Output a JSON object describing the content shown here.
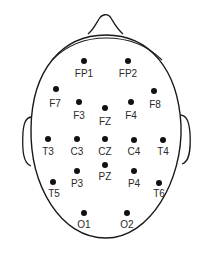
{
  "diagram": {
    "title": "",
    "type": "EEG 10-20 electrode placement (top view of head)",
    "colors": {
      "line": "#1a1a1a",
      "dot": "#111111",
      "text": "#2a2a2a",
      "background": "#ffffff"
    },
    "electrodes": [
      {
        "id": "fp1",
        "label": "FP1",
        "x": 84,
        "y": 61,
        "lx": 84,
        "ly": 69
      },
      {
        "id": "fp2",
        "label": "FP2",
        "x": 128,
        "y": 61,
        "lx": 128,
        "ly": 69
      },
      {
        "id": "f7",
        "label": "F7",
        "x": 56,
        "y": 89,
        "lx": 55,
        "ly": 99
      },
      {
        "id": "f8",
        "label": "F8",
        "x": 154,
        "y": 91,
        "lx": 155,
        "ly": 100
      },
      {
        "id": "f3",
        "label": "F3",
        "x": 79,
        "y": 102,
        "lx": 79,
        "ly": 111
      },
      {
        "id": "fz",
        "label": "FZ",
        "x": 105,
        "y": 108,
        "lx": 105,
        "ly": 117
      },
      {
        "id": "f4",
        "label": "F4",
        "x": 131,
        "y": 102,
        "lx": 131,
        "ly": 111
      },
      {
        "id": "t3",
        "label": "T3",
        "x": 48,
        "y": 139,
        "lx": 48,
        "ly": 147
      },
      {
        "id": "c3",
        "label": "C3",
        "x": 77,
        "y": 139,
        "lx": 77,
        "ly": 147
      },
      {
        "id": "cz",
        "label": "CZ",
        "x": 105,
        "y": 139,
        "lx": 105,
        "ly": 147
      },
      {
        "id": "c4",
        "label": "C4",
        "x": 134,
        "y": 140,
        "lx": 134,
        "ly": 147
      },
      {
        "id": "t4",
        "label": "T4",
        "x": 163,
        "y": 140,
        "lx": 163,
        "ly": 147
      },
      {
        "id": "pz",
        "label": "PZ",
        "x": 105,
        "y": 165,
        "lx": 105,
        "ly": 172
      },
      {
        "id": "p3",
        "label": "P3",
        "x": 77,
        "y": 171,
        "lx": 77,
        "ly": 179
      },
      {
        "id": "p4",
        "label": "P4",
        "x": 134,
        "y": 171,
        "lx": 134,
        "ly": 179
      },
      {
        "id": "t5",
        "label": "T5",
        "x": 53,
        "y": 182,
        "lx": 54,
        "ly": 189
      },
      {
        "id": "t6",
        "label": "T6",
        "x": 159,
        "y": 183,
        "lx": 159,
        "ly": 189
      },
      {
        "id": "o1",
        "label": "O1",
        "x": 84,
        "y": 213,
        "lx": 84,
        "ly": 220
      },
      {
        "id": "o2",
        "label": "O2",
        "x": 127,
        "y": 213,
        "lx": 127,
        "ly": 220
      }
    ]
  }
}
